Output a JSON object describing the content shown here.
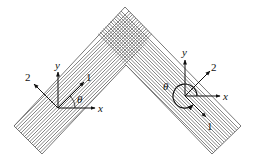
{
  "figure": {
    "left_frame": {
      "x_label": "x",
      "y_label": "y",
      "axis1_label": "1",
      "axis2_label": "2",
      "angle_label": "θ"
    },
    "right_frame": {
      "x_label": "x",
      "y_label": "y",
      "axis1_label": "1",
      "axis2_label": "2",
      "angle_label": "θ"
    },
    "colors": {
      "line": "#555555",
      "axis": "#111111",
      "background": "#ffffff"
    }
  }
}
